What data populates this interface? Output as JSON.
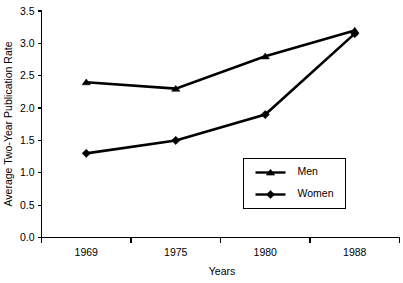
{
  "chart_data": {
    "type": "line",
    "title": "",
    "xlabel": "Years",
    "ylabel": "Average Two-Year Publication Rate",
    "categories": [
      "1969",
      "1975",
      "1980",
      "1988"
    ],
    "ylim": [
      0.0,
      3.5
    ],
    "ytick_labels": [
      "0.0",
      "0.5",
      "1.0",
      "1.5",
      "2.0",
      "2.5",
      "3.0",
      "3.5"
    ],
    "ytick_values": [
      0.0,
      0.5,
      1.0,
      1.5,
      2.0,
      2.5,
      3.0,
      3.5
    ],
    "grid": false,
    "legend_position": "inside-lower-right",
    "series": [
      {
        "name": "Men",
        "marker": "triangle",
        "color": "#000000",
        "values": [
          2.4,
          2.3,
          2.8,
          3.2
        ]
      },
      {
        "name": "Women",
        "marker": "diamond",
        "color": "#000000",
        "values": [
          1.3,
          1.5,
          1.9,
          3.15
        ]
      }
    ]
  },
  "legend": {
    "items": [
      {
        "label": "Men"
      },
      {
        "label": "Women"
      }
    ]
  },
  "colors": {
    "axis": "#000000",
    "series": "#000000",
    "background": "#ffffff"
  }
}
